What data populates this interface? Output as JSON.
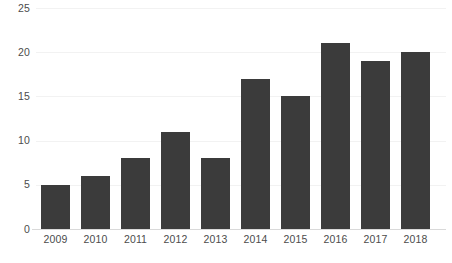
{
  "chart_data": {
    "type": "bar",
    "title": "",
    "subtitle": "",
    "xlabel": "",
    "ylabel": "",
    "categories": [
      "2009",
      "2010",
      "2011",
      "2012",
      "2013",
      "2014",
      "2015",
      "2016",
      "2017",
      "2018"
    ],
    "values": [
      5,
      6,
      8,
      11,
      8,
      17,
      15,
      21,
      19,
      20
    ],
    "ylim": [
      0,
      25
    ],
    "yticks": [
      0,
      5,
      10,
      15,
      20,
      25
    ],
    "ytick_labels": [
      "0",
      "5",
      "10",
      "15",
      "20",
      "25"
    ],
    "xtick_labels": [
      "2009",
      "2010",
      "2011",
      "2012",
      "2013",
      "2014",
      "2015",
      "2016",
      "2017",
      "2018"
    ],
    "grid": true,
    "grid_axis": "y",
    "legend": false,
    "legend_position": "none",
    "bar_color": "#3b3b3b",
    "gridline_color": "#f2f2f2",
    "axis_color": "#d9d9d9",
    "tick_label_color": "#4c4c4c",
    "background_color": "#ffffff",
    "data_labels": false
  }
}
